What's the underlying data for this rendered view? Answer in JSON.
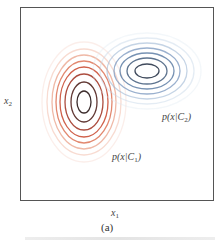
{
  "chart_data": {
    "type": "contour",
    "title": "",
    "panel_label": "(a)",
    "xlabel": "x1",
    "ylabel": "x2",
    "grid": false,
    "legend": null,
    "series": [
      {
        "name": "p(x|C1)",
        "label_text": "p(x|C",
        "label_sub": "1",
        "color_inner": "#3a2a2a",
        "color_mid": "#c8452c",
        "color_outer": "#f0c9bc",
        "center_px": [
          84,
          102
        ],
        "levels": [
          {
            "rx": 7,
            "ry": 11,
            "color": "#3b2b2b",
            "opacity": 1.0
          },
          {
            "rx": 13,
            "ry": 20,
            "color": "#5a2e2a",
            "opacity": 0.95
          },
          {
            "rx": 19,
            "ry": 28,
            "color": "#a33a2a",
            "opacity": 0.9
          },
          {
            "rx": 24,
            "ry": 35,
            "color": "#c8452c",
            "opacity": 0.85
          },
          {
            "rx": 28,
            "ry": 41,
            "color": "#d8603f",
            "opacity": 0.75
          },
          {
            "rx": 32,
            "ry": 47,
            "color": "#e58a6d",
            "opacity": 0.6
          },
          {
            "rx": 37,
            "ry": 53,
            "color": "#efb09a",
            "opacity": 0.45
          },
          {
            "rx": 42,
            "ry": 60,
            "color": "#f3cfc2",
            "opacity": 0.35
          }
        ]
      },
      {
        "name": "p(x|C2)",
        "label_text": "p(x|C",
        "label_sub": "2",
        "color_inner": "#3a4250",
        "color_mid": "#6b8db8",
        "color_outer": "#cfe0f0",
        "center_px": [
          147,
          71
        ],
        "levels": [
          {
            "rx": 12,
            "ry": 7,
            "color": "#3f4a5c",
            "opacity": 1.0
          },
          {
            "rx": 20,
            "ry": 13,
            "color": "#4d6583",
            "opacity": 0.9
          },
          {
            "rx": 27,
            "ry": 18,
            "color": "#5f7fa6",
            "opacity": 0.85
          },
          {
            "rx": 33,
            "ry": 23,
            "color": "#7896bd",
            "opacity": 0.75
          },
          {
            "rx": 40,
            "ry": 28,
            "color": "#9fb7d3",
            "opacity": 0.6
          },
          {
            "rx": 47,
            "ry": 33,
            "color": "#c4d5e6",
            "opacity": 0.45
          },
          {
            "rx": 54,
            "ry": 38,
            "color": "#dde7f1",
            "opacity": 0.35
          }
        ]
      }
    ]
  },
  "labels": {
    "x_axis_main": "x",
    "x_axis_sub": "1",
    "y_axis_main": "x",
    "y_axis_sub": "2",
    "panel": "(a)",
    "c1_text": "p(x|C",
    "c1_sub": "1",
    "c1_close": ")",
    "c2_text": "p(x|C",
    "c2_sub": "2",
    "c2_close": ")"
  }
}
